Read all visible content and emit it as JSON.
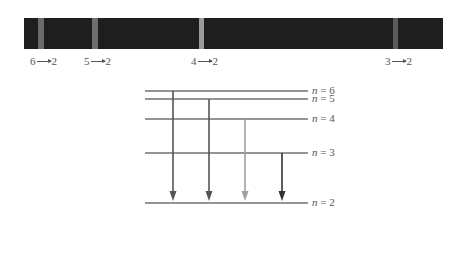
{
  "spectrum": {
    "background": "#1e1e1e",
    "bands": [
      {
        "label_from": "6",
        "label_to": "2",
        "x": 38,
        "width": 6,
        "color": "#6a6a6a",
        "label_x": 30
      },
      {
        "label_from": "5",
        "label_to": "2",
        "x": 92,
        "width": 6,
        "color": "#6e6e6e",
        "label_x": 84
      },
      {
        "label_from": "4",
        "label_to": "2",
        "x": 199,
        "width": 5,
        "color": "#9a9a9a",
        "label_x": 191
      },
      {
        "label_from": "3",
        "label_to": "2",
        "x": 393,
        "width": 5,
        "color": "#5a5a5a",
        "label_x": 385
      }
    ]
  },
  "energy_levels": {
    "x_start": 145,
    "x_end": 308,
    "levels": [
      {
        "n": "6",
        "label": "n = 6",
        "y": 91
      },
      {
        "n": "5",
        "label": "n = 5",
        "y": 99
      },
      {
        "n": "4",
        "label": "n = 4",
        "y": 119
      },
      {
        "n": "3",
        "label": "n = 3",
        "y": 153
      },
      {
        "n": "2",
        "label": "n = 2",
        "y": 203
      }
    ],
    "transitions": [
      {
        "from": "6",
        "to": "2",
        "x": 173,
        "y_start": 91,
        "color": "#555555"
      },
      {
        "from": "5",
        "to": "2",
        "x": 209,
        "y_start": 99,
        "color": "#555555"
      },
      {
        "from": "4",
        "to": "2",
        "x": 245,
        "y_start": 119,
        "color": "#a0a0a0"
      },
      {
        "from": "3",
        "to": "2",
        "x": 282,
        "y_start": 153,
        "color": "#333333"
      }
    ]
  }
}
